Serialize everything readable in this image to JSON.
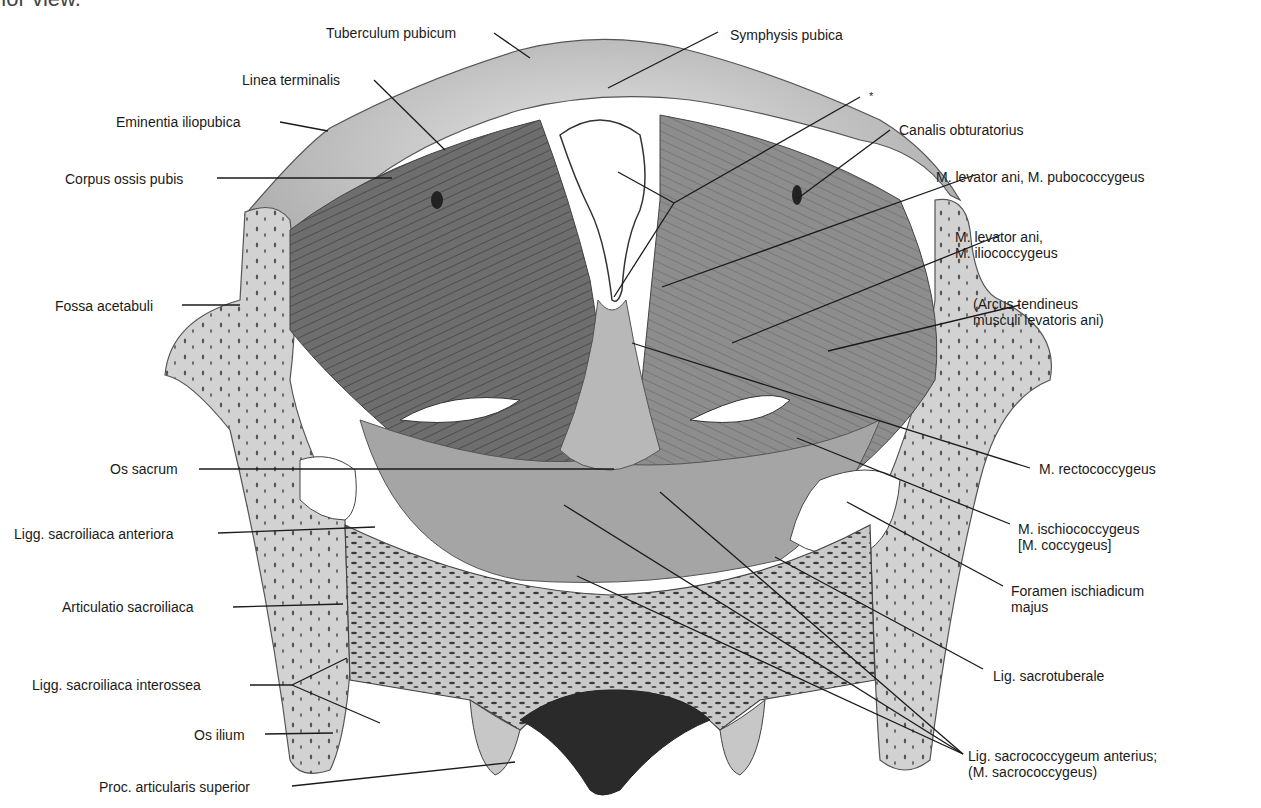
{
  "caption": "rior view.",
  "figure": {
    "colors": {
      "background": "#ffffff",
      "bone": "#cfcfcf",
      "muscle": "#8a8a8a",
      "dark_muscle": "#4a4a4a",
      "leader": "#1a1a1a",
      "text": "#1a1a1a"
    }
  },
  "labels": {
    "tuberculum_pubicum": "Tuberculum pubicum",
    "symphysis_pubica": "Symphysis pubica",
    "linea_terminalis": "Linea terminalis",
    "asterisk": "*",
    "eminentia_iliopubica": "Eminentia iliopubica",
    "canalis_obturatorius": "Canalis obturatorius",
    "corpus_ossis_pubis": "Corpus ossis pubis",
    "pubococcygeus": "M. levator ani, M. pubococcygeus",
    "iliococcygeus_1": "M. levator ani,",
    "iliococcygeus_2": "M. iliococcygeus",
    "fossa_acetabuli": "Fossa acetabuli",
    "arcus_1": "(Arcus tendineus",
    "arcus_2": "musculi levatoris ani)",
    "os_sacrum": "Os sacrum",
    "rectococcygeus": "M. rectococcygeus",
    "ligg_sacroiliaca_anteriora": "Ligg. sacroiliaca anteriora",
    "ischiococcygeus_1": "M. ischiococcygeus",
    "ischiococcygeus_2": "[M. coccygeus]",
    "articulatio_sacroiliaca": "Articulatio sacroiliaca",
    "foramen_1": "Foramen ischiadicum",
    "foramen_2": "majus",
    "lig_sacrotuberale": "Lig. sacrotuberale",
    "ligg_sacroiliaca_interossea": "Ligg. sacroiliaca interossea",
    "os_ilium": "Os ilium",
    "sacrococcygeum_1": "Lig. sacrococcygeum anterius;",
    "sacrococcygeum_2": "(M. sacrococcygeus)",
    "proc_articularis_superior": "Proc. articularis superior"
  }
}
